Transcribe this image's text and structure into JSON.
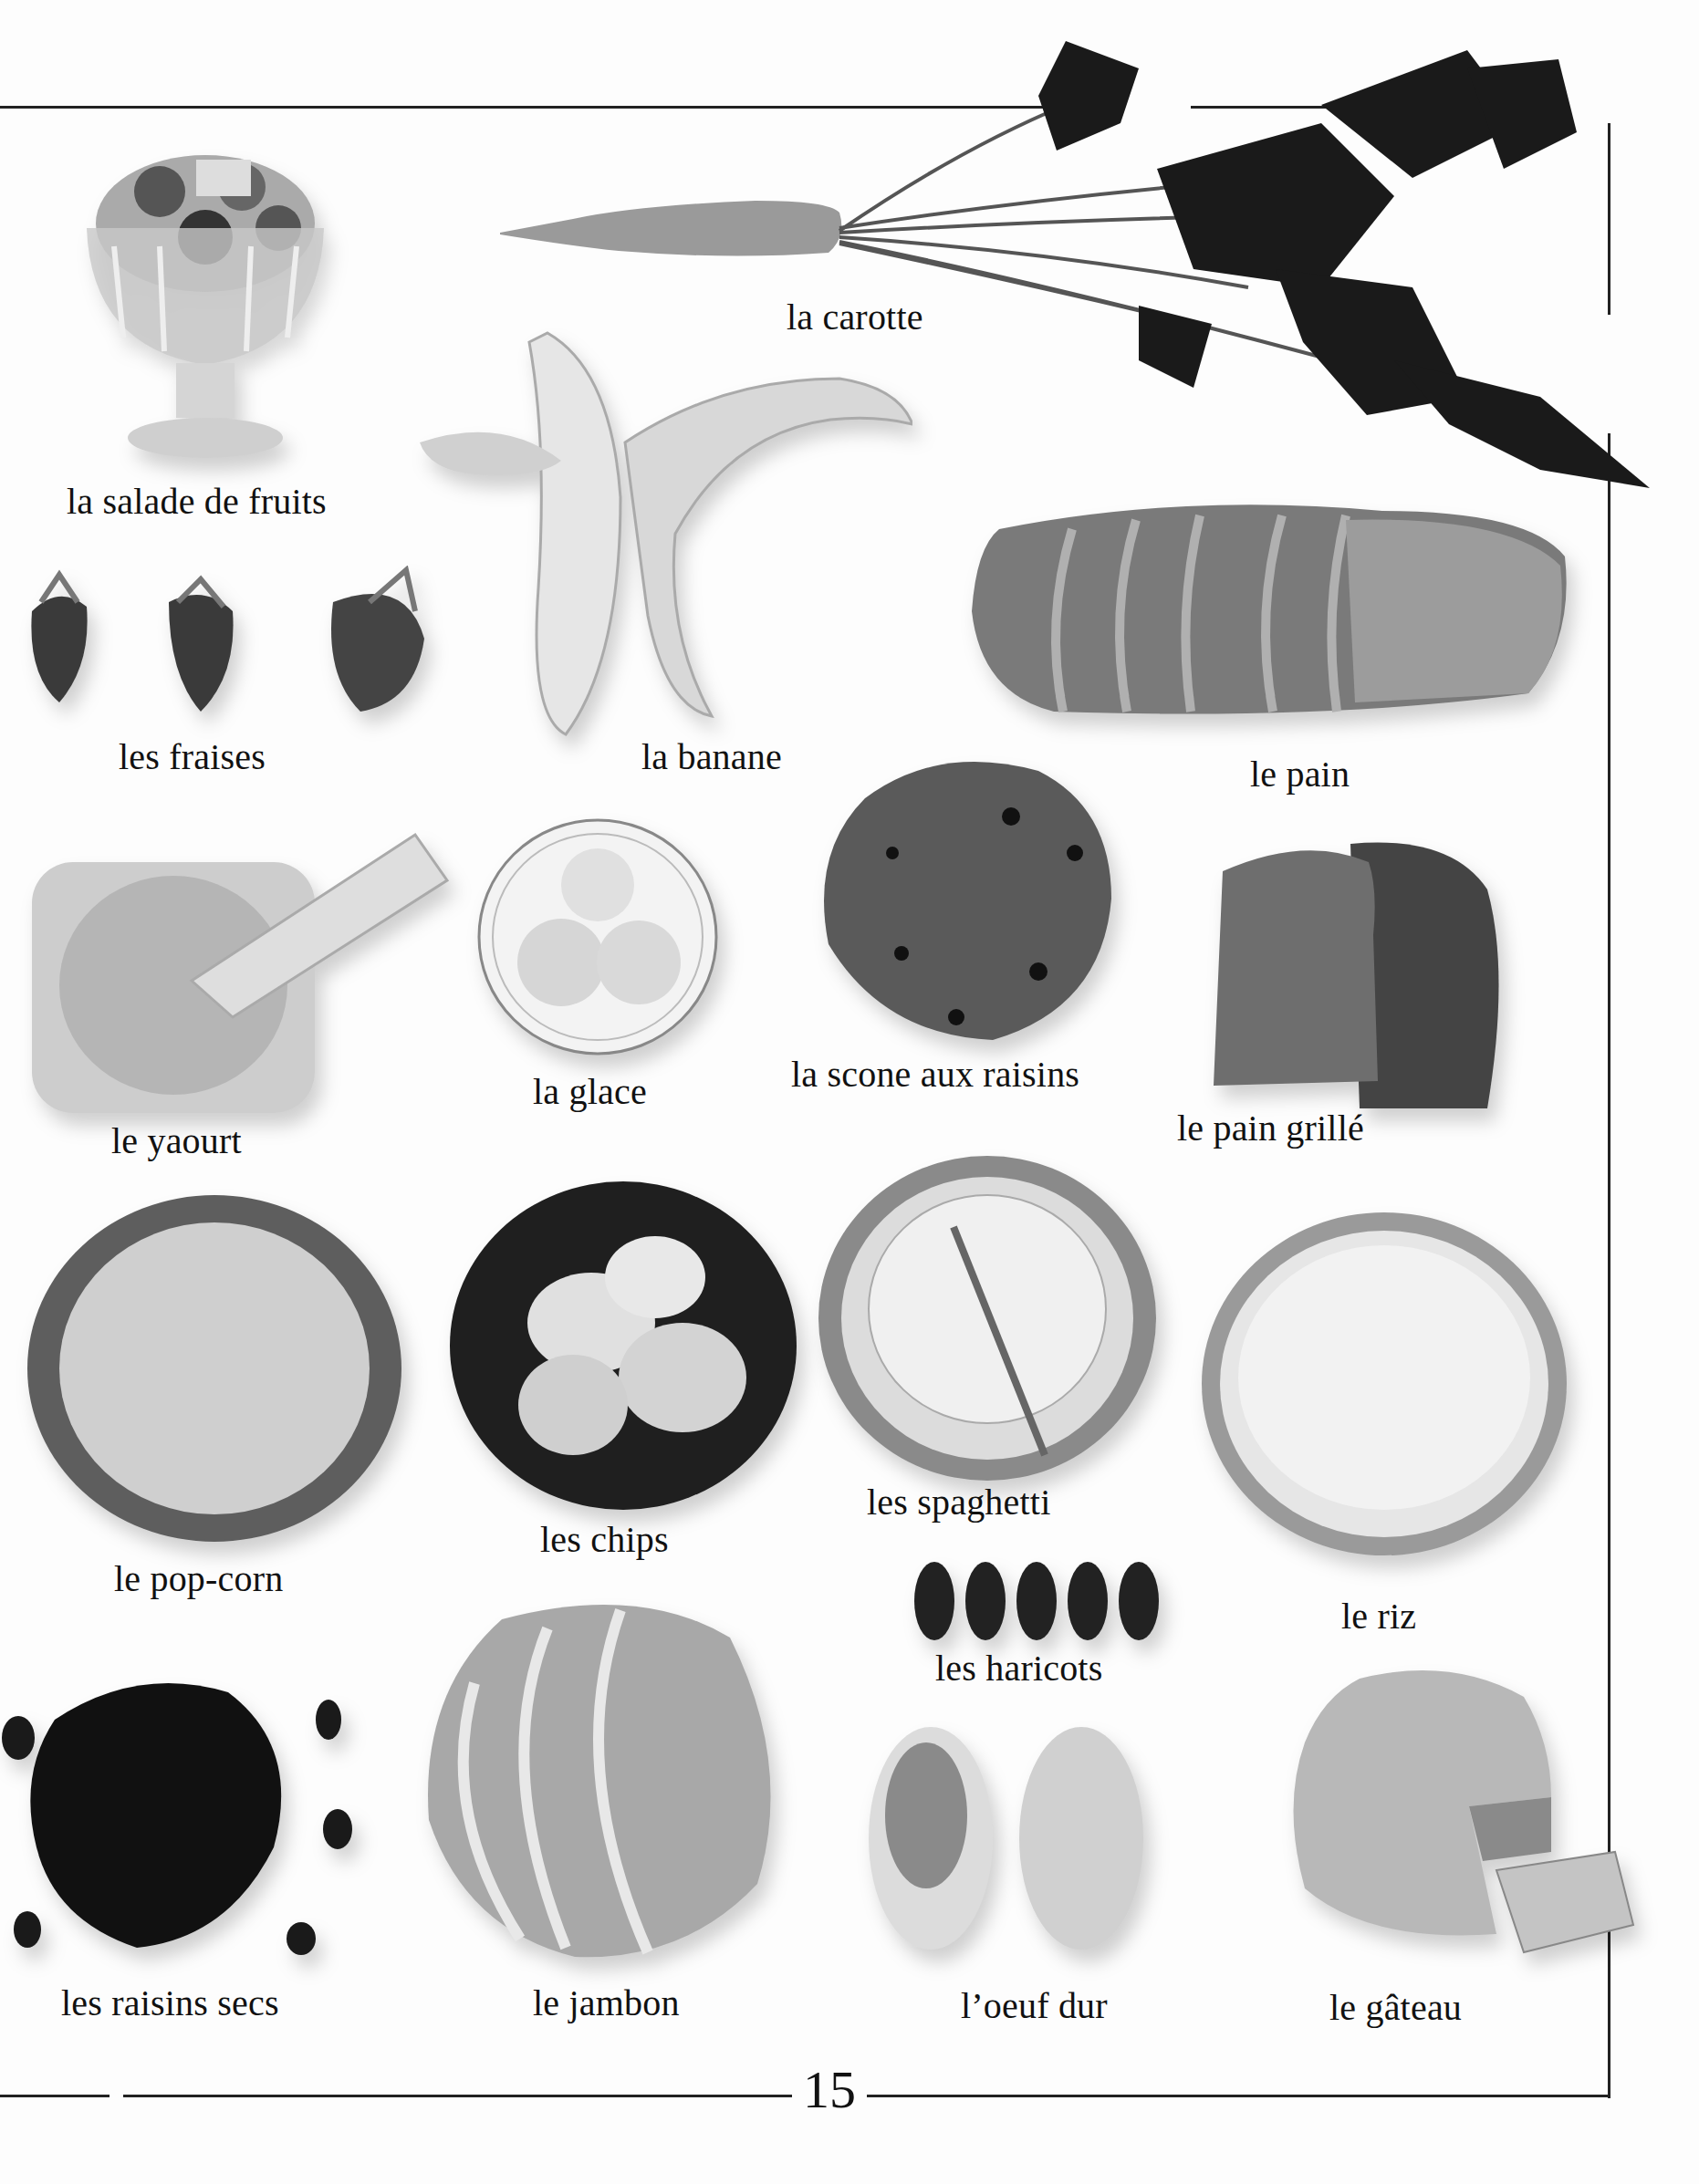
{
  "page": {
    "number": "15",
    "background": "#fdfdfd",
    "rule_color": "#222222"
  },
  "items": [
    {
      "id": "salade-de-fruits",
      "label": "la salade de fruits",
      "icon": "fruit-salad-bowl-icon"
    },
    {
      "id": "carotte",
      "label": "la carotte",
      "icon": "carrot-icon"
    },
    {
      "id": "fraises",
      "label": "les fraises",
      "icon": "strawberries-icon"
    },
    {
      "id": "banane",
      "label": "la banane",
      "icon": "peeled-banana-icon"
    },
    {
      "id": "pain",
      "label": "le pain",
      "icon": "bread-loaf-icon"
    },
    {
      "id": "yaourt",
      "label": "le yaourt",
      "icon": "yogurt-cup-icon"
    },
    {
      "id": "glace",
      "label": "la glace",
      "icon": "ice-cream-plate-icon"
    },
    {
      "id": "scone",
      "label": "la scone aux raisins",
      "icon": "raisin-scone-icon"
    },
    {
      "id": "pain-grille",
      "label": "le pain grillé",
      "icon": "toast-slices-icon"
    },
    {
      "id": "pop-corn",
      "label": "le pop-corn",
      "icon": "popcorn-plate-icon"
    },
    {
      "id": "chips",
      "label": "les chips",
      "icon": "crisps-bowl-icon"
    },
    {
      "id": "spaghetti",
      "label": "les spaghetti",
      "icon": "spaghetti-plate-icon"
    },
    {
      "id": "riz",
      "label": "le riz",
      "icon": "rice-plate-icon"
    },
    {
      "id": "haricots",
      "label": "les haricots",
      "icon": "kidney-beans-icon"
    },
    {
      "id": "raisins-secs",
      "label": "les raisins secs",
      "icon": "raisins-pile-icon"
    },
    {
      "id": "jambon",
      "label": "le jambon",
      "icon": "ham-slices-icon"
    },
    {
      "id": "oeuf-dur",
      "label": "l’oeuf dur",
      "icon": "boiled-egg-icon"
    },
    {
      "id": "gateau",
      "label": "le gâteau",
      "icon": "cake-slice-icon"
    }
  ]
}
